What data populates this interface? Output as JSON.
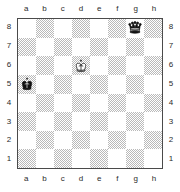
{
  "diagram": {
    "type": "chessboard",
    "orientation": "white-bottom",
    "colors": {
      "light_square": "#ffffff",
      "dark_square": "#c8c8c8",
      "border": "#4a4a4a",
      "label_text": "#2b2b2b",
      "white_piece": "#ffffff",
      "black_piece": "#111111"
    },
    "files": [
      "a",
      "b",
      "c",
      "d",
      "e",
      "f",
      "g",
      "h"
    ],
    "ranks": [
      "8",
      "7",
      "6",
      "5",
      "4",
      "3",
      "2",
      "1"
    ],
    "labels": {
      "top_files": [
        "a",
        "b",
        "c",
        "d",
        "e",
        "f",
        "g",
        "h"
      ],
      "bottom_files": [
        "a",
        "b",
        "c",
        "d",
        "e",
        "f",
        "g",
        "h"
      ],
      "left_ranks": [
        "8",
        "7",
        "6",
        "5",
        "4",
        "3",
        "2",
        "1"
      ],
      "right_ranks": [
        "8",
        "7",
        "6",
        "5",
        "4",
        "3",
        "2",
        "1"
      ]
    },
    "pieces": [
      {
        "square": "g8",
        "color": "black",
        "type": "queen",
        "glyph": "black-queen"
      },
      {
        "square": "d6",
        "color": "white",
        "type": "king",
        "glyph": "white-king"
      },
      {
        "square": "a5",
        "color": "black",
        "type": "king",
        "glyph": "black-king"
      }
    ],
    "board": [
      [
        {
          "square": "a8",
          "shade": "light",
          "piece": null
        },
        {
          "square": "b8",
          "shade": "dark",
          "piece": null
        },
        {
          "square": "c8",
          "shade": "light",
          "piece": null
        },
        {
          "square": "d8",
          "shade": "dark",
          "piece": null
        },
        {
          "square": "e8",
          "shade": "light",
          "piece": null
        },
        {
          "square": "f8",
          "shade": "dark",
          "piece": null
        },
        {
          "square": "g8",
          "shade": "light",
          "piece": "black-queen"
        },
        {
          "square": "h8",
          "shade": "dark",
          "piece": null
        }
      ],
      [
        {
          "square": "a7",
          "shade": "dark",
          "piece": null
        },
        {
          "square": "b7",
          "shade": "light",
          "piece": null
        },
        {
          "square": "c7",
          "shade": "dark",
          "piece": null
        },
        {
          "square": "d7",
          "shade": "light",
          "piece": null
        },
        {
          "square": "e7",
          "shade": "dark",
          "piece": null
        },
        {
          "square": "f7",
          "shade": "light",
          "piece": null
        },
        {
          "square": "g7",
          "shade": "dark",
          "piece": null
        },
        {
          "square": "h7",
          "shade": "light",
          "piece": null
        }
      ],
      [
        {
          "square": "a6",
          "shade": "light",
          "piece": null
        },
        {
          "square": "b6",
          "shade": "dark",
          "piece": null
        },
        {
          "square": "c6",
          "shade": "light",
          "piece": null
        },
        {
          "square": "d6",
          "shade": "dark",
          "piece": "white-king"
        },
        {
          "square": "e6",
          "shade": "light",
          "piece": null
        },
        {
          "square": "f6",
          "shade": "dark",
          "piece": null
        },
        {
          "square": "g6",
          "shade": "light",
          "piece": null
        },
        {
          "square": "h6",
          "shade": "dark",
          "piece": null
        }
      ],
      [
        {
          "square": "a5",
          "shade": "dark",
          "piece": "black-king"
        },
        {
          "square": "b5",
          "shade": "light",
          "piece": null
        },
        {
          "square": "c5",
          "shade": "dark",
          "piece": null
        },
        {
          "square": "d5",
          "shade": "light",
          "piece": null
        },
        {
          "square": "e5",
          "shade": "dark",
          "piece": null
        },
        {
          "square": "f5",
          "shade": "light",
          "piece": null
        },
        {
          "square": "g5",
          "shade": "dark",
          "piece": null
        },
        {
          "square": "h5",
          "shade": "light",
          "piece": null
        }
      ],
      [
        {
          "square": "a4",
          "shade": "light",
          "piece": null
        },
        {
          "square": "b4",
          "shade": "dark",
          "piece": null
        },
        {
          "square": "c4",
          "shade": "light",
          "piece": null
        },
        {
          "square": "d4",
          "shade": "dark",
          "piece": null
        },
        {
          "square": "e4",
          "shade": "light",
          "piece": null
        },
        {
          "square": "f4",
          "shade": "dark",
          "piece": null
        },
        {
          "square": "g4",
          "shade": "light",
          "piece": null
        },
        {
          "square": "h4",
          "shade": "dark",
          "piece": null
        }
      ],
      [
        {
          "square": "a3",
          "shade": "dark",
          "piece": null
        },
        {
          "square": "b3",
          "shade": "light",
          "piece": null
        },
        {
          "square": "c3",
          "shade": "dark",
          "piece": null
        },
        {
          "square": "d3",
          "shade": "light",
          "piece": null
        },
        {
          "square": "e3",
          "shade": "dark",
          "piece": null
        },
        {
          "square": "f3",
          "shade": "light",
          "piece": null
        },
        {
          "square": "g3",
          "shade": "dark",
          "piece": null
        },
        {
          "square": "h3",
          "shade": "light",
          "piece": null
        }
      ],
      [
        {
          "square": "a2",
          "shade": "light",
          "piece": null
        },
        {
          "square": "b2",
          "shade": "dark",
          "piece": null
        },
        {
          "square": "c2",
          "shade": "light",
          "piece": null
        },
        {
          "square": "d2",
          "shade": "dark",
          "piece": null
        },
        {
          "square": "e2",
          "shade": "light",
          "piece": null
        },
        {
          "square": "f2",
          "shade": "dark",
          "piece": null
        },
        {
          "square": "g2",
          "shade": "light",
          "piece": null
        },
        {
          "square": "h2",
          "shade": "dark",
          "piece": null
        }
      ],
      [
        {
          "square": "a1",
          "shade": "dark",
          "piece": null
        },
        {
          "square": "b1",
          "shade": "light",
          "piece": null
        },
        {
          "square": "c1",
          "shade": "dark",
          "piece": null
        },
        {
          "square": "d1",
          "shade": "light",
          "piece": null
        },
        {
          "square": "e1",
          "shade": "dark",
          "piece": null
        },
        {
          "square": "f1",
          "shade": "light",
          "piece": null
        },
        {
          "square": "g1",
          "shade": "dark",
          "piece": null
        },
        {
          "square": "h1",
          "shade": "light",
          "piece": null
        }
      ]
    ]
  }
}
